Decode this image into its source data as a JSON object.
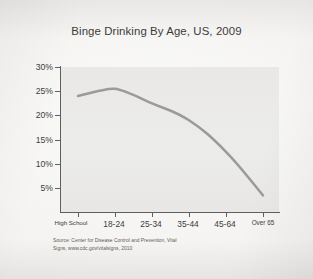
{
  "chart_data": {
    "type": "line",
    "title": "Binge Drinking By Age, US, 2009",
    "xlabel": "",
    "ylabel": "",
    "categories": [
      "High School",
      "18-24",
      "25-34",
      "35-44",
      "45-64",
      "Over 65"
    ],
    "values": [
      24,
      25.5,
      22.5,
      19,
      12.5,
      3.5
    ],
    "series": [
      {
        "name": "Binge drinking prevalence",
        "values": [
          24,
          25.5,
          22.5,
          19,
          12.5,
          3.5
        ]
      }
    ],
    "ytick_labels": [
      "30%",
      "25%",
      "20%",
      "15%",
      "10%",
      "5%"
    ],
    "ytick_values": [
      30,
      25,
      20,
      15,
      10,
      5
    ],
    "ylim": [
      0,
      30
    ],
    "grid": false,
    "legend": false,
    "line_color": "#9a9a9a",
    "plot_background": "#eae9e7"
  },
  "source": {
    "line1": "Source: Center for Disease Control and Prevention, Vital",
    "line2": "Signs, www.cdc.gov/vitalsigns, 2010"
  }
}
